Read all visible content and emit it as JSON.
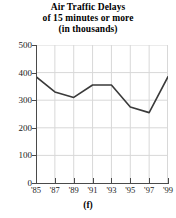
{
  "chart_data": {
    "type": "line",
    "title": "Air Traffic Delays of 15 minutes or more (in thousands)",
    "title_lines": [
      "Air Traffic Delays",
      "of 15 minutes or more",
      "(in thousands)"
    ],
    "caption": "(f)",
    "xlabel": "",
    "ylabel": "",
    "categories": [
      "'85",
      "'87",
      "'89",
      "'91",
      "'93",
      "'95",
      "'97",
      "'99"
    ],
    "x_values": [
      1985,
      1987,
      1989,
      1991,
      1993,
      1995,
      1997,
      1999
    ],
    "values": [
      385,
      330,
      310,
      355,
      355,
      275,
      255,
      385
    ],
    "series": [
      {
        "name": "Air traffic delays of 15 minutes or more (thousands)",
        "values": [
          385,
          330,
          310,
          355,
          355,
          275,
          255,
          385
        ]
      }
    ],
    "ylim": [
      0,
      500
    ],
    "xlim": [
      1985,
      1999
    ],
    "y_ticks": [
      0,
      100,
      200,
      300,
      400,
      500
    ],
    "y_tick_labels": [
      "0",
      "100",
      "200",
      "300",
      "400",
      "500"
    ],
    "x_ticks": [
      1985,
      1987,
      1989,
      1991,
      1993,
      1995,
      1997,
      1999
    ],
    "x_tick_labels": [
      "'85",
      "'87",
      "'89",
      "'91",
      "'93",
      "'95",
      "'97",
      "'99"
    ],
    "grid": true,
    "grid_axis": "both",
    "legend": false,
    "legend_position": "none",
    "markers": false,
    "line_color": "#3a3a3a",
    "grid_color": "#d8d8d8",
    "axis_color": "#4a4a4a",
    "background_color": "#ffffff",
    "text_color": "#000000",
    "line_width": 1.6
  }
}
